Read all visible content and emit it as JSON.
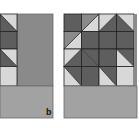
{
  "figure": {
    "panel_label": "b",
    "colors": {
      "dark": "#5e5e5e",
      "mid": "#8a8a8a",
      "light": "#d8d8d8",
      "bottom": "#a2a2a2",
      "line": "#222222",
      "frame": "#6a6a6a"
    },
    "left_panel": {
      "strip_cells": [
        {
          "type": "half",
          "diag": "tl-br",
          "upper": "light",
          "lower": "dark"
        },
        {
          "type": "solid",
          "fill": "dark"
        },
        {
          "type": "half",
          "diag": "tl-br",
          "upper": "light",
          "lower": "dark"
        },
        {
          "type": "solid",
          "fill": "light"
        }
      ],
      "main_fill": "mid",
      "bottom_fill": "bottom"
    },
    "right_panel": {
      "rows": [
        [
          {
            "type": "solid",
            "fill": "dark"
          },
          {
            "type": "half",
            "diag": "tr-bl",
            "upper": "mid",
            "lower": "light"
          },
          {
            "type": "half",
            "diag": "tr-bl",
            "upper": "light",
            "lower": "dark"
          },
          {
            "type": "half",
            "diag": "tl-br",
            "upper": "light",
            "lower": "dark"
          }
        ],
        [
          {
            "type": "half",
            "diag": "tr-bl",
            "upper": "mid",
            "lower": "light"
          },
          {
            "type": "solid",
            "fill": "dark"
          },
          {
            "type": "solid",
            "fill": "dark"
          },
          {
            "type": "solid",
            "fill": "dark"
          }
        ],
        [
          {
            "type": "half",
            "diag": "tr-bl",
            "upper": "light",
            "lower": "dark"
          },
          {
            "type": "half",
            "diag": "tl-br",
            "upper": "dark",
            "lower": "dark"
          },
          {
            "type": "solid",
            "fill": "dark"
          },
          {
            "type": "half",
            "diag": "tl-br",
            "upper": "dark",
            "lower": "light"
          }
        ],
        [
          {
            "type": "half",
            "diag": "tl-br",
            "upper": "dark",
            "lower": "light"
          },
          {
            "type": "solid",
            "fill": "dark"
          },
          {
            "type": "half",
            "diag": "tl-br",
            "upper": "dark",
            "lower": "light"
          },
          {
            "type": "solid",
            "fill": "light"
          }
        ]
      ],
      "bottom_fill": "bottom"
    }
  }
}
